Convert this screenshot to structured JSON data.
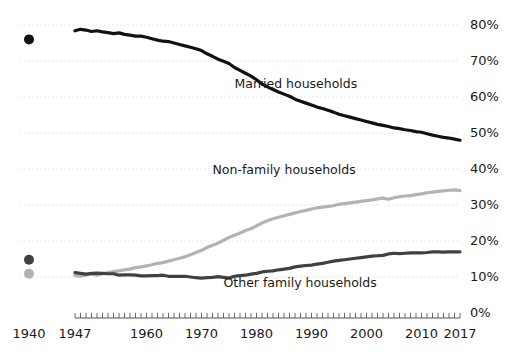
{
  "chart_data": {
    "type": "line",
    "title": "",
    "xlabel": "",
    "ylabel": "",
    "xlim": [
      1947,
      2017
    ],
    "ylim": [
      0,
      85
    ],
    "grid": true,
    "legend_position": "inline-annotations",
    "y_ticks": [
      "0%",
      "10%",
      "20%",
      "30%",
      "40%",
      "50%",
      "60%",
      "70%",
      "80%"
    ],
    "y_tick_values": [
      0,
      10,
      20,
      30,
      40,
      50,
      60,
      70,
      80
    ],
    "x_ticks": [
      "1940",
      "1947",
      "1960",
      "1970",
      "1980",
      "1990",
      "2000",
      "2010",
      "2017"
    ],
    "x_tick_values": [
      1940,
      1947,
      1960,
      1970,
      1980,
      1990,
      2000,
      2010,
      2017
    ],
    "x_tick_detached": [
      1940
    ],
    "x_minor_tick_step": 1,
    "detached_points": [
      {
        "label": "Married households",
        "year": 1940,
        "value": 76.0,
        "color": "#111111"
      },
      {
        "label": "Other family households",
        "year": 1940,
        "value": 14.8,
        "color": "#404040"
      },
      {
        "label": "Non-family households",
        "year": 1940,
        "value": 10.9,
        "color": "#b3b3b3"
      }
    ],
    "series": [
      {
        "name": "Married households",
        "color": "#111111",
        "width": 3.2,
        "label_x": 1976,
        "label_y": 62.5,
        "x": [
          1947,
          1948,
          1949,
          1950,
          1951,
          1952,
          1953,
          1954,
          1955,
          1956,
          1957,
          1958,
          1959,
          1960,
          1961,
          1962,
          1963,
          1964,
          1965,
          1966,
          1967,
          1968,
          1969,
          1970,
          1971,
          1972,
          1973,
          1974,
          1975,
          1976,
          1977,
          1978,
          1979,
          1980,
          1981,
          1982,
          1983,
          1984,
          1985,
          1986,
          1987,
          1988,
          1989,
          1990,
          1991,
          1992,
          1993,
          1994,
          1995,
          1996,
          1997,
          1998,
          1999,
          2000,
          2001,
          2002,
          2003,
          2004,
          2005,
          2006,
          2007,
          2008,
          2009,
          2010,
          2011,
          2012,
          2013,
          2014,
          2015,
          2016,
          2017
        ],
        "values": [
          78.4,
          78.8,
          78.6,
          78.2,
          78.4,
          78.1,
          77.9,
          77.6,
          77.8,
          77.4,
          77.2,
          76.9,
          76.9,
          76.6,
          76.2,
          75.8,
          75.5,
          75.4,
          75.0,
          74.6,
          74.2,
          73.8,
          73.4,
          72.9,
          72.0,
          71.3,
          70.5,
          69.9,
          69.3,
          68.2,
          67.4,
          66.6,
          65.8,
          64.8,
          63.6,
          62.8,
          62.1,
          61.4,
          60.8,
          60.2,
          59.4,
          58.8,
          58.3,
          57.8,
          57.2,
          56.8,
          56.3,
          55.8,
          55.2,
          54.8,
          54.4,
          54.0,
          53.6,
          53.2,
          52.8,
          52.4,
          52.1,
          51.8,
          51.4,
          51.2,
          50.9,
          50.7,
          50.4,
          50.2,
          49.8,
          49.4,
          49.1,
          48.8,
          48.6,
          48.3,
          48.0
        ]
      },
      {
        "name": "Non-family households",
        "color": "#b3b3b3",
        "width": 3.2,
        "label_x": 1972,
        "label_y": 38.5,
        "x": [
          1947,
          1948,
          1949,
          1950,
          1951,
          1952,
          1953,
          1954,
          1955,
          1956,
          1957,
          1958,
          1959,
          1960,
          1961,
          1962,
          1963,
          1964,
          1965,
          1966,
          1967,
          1968,
          1969,
          1970,
          1971,
          1972,
          1973,
          1974,
          1975,
          1976,
          1977,
          1978,
          1979,
          1980,
          1981,
          1982,
          1983,
          1984,
          1985,
          1986,
          1987,
          1988,
          1989,
          1990,
          1991,
          1992,
          1993,
          1994,
          1995,
          1996,
          1997,
          1998,
          1999,
          2000,
          2001,
          2002,
          2003,
          2004,
          2005,
          2006,
          2007,
          2008,
          2009,
          2010,
          2011,
          2012,
          2013,
          2014,
          2015,
          2016,
          2017
        ],
        "values": [
          10.4,
          10.2,
          10.6,
          10.8,
          10.5,
          10.9,
          11.2,
          11.5,
          11.7,
          12.0,
          12.2,
          12.6,
          12.8,
          13.1,
          13.4,
          13.8,
          14.0,
          14.4,
          14.8,
          15.2,
          15.6,
          16.2,
          16.8,
          17.4,
          18.2,
          18.8,
          19.4,
          20.2,
          21.0,
          21.6,
          22.2,
          22.9,
          23.4,
          24.2,
          25.0,
          25.6,
          26.2,
          26.6,
          27.0,
          27.4,
          27.8,
          28.2,
          28.5,
          28.9,
          29.2,
          29.4,
          29.6,
          29.8,
          30.2,
          30.4,
          30.6,
          30.8,
          31.0,
          31.2,
          31.4,
          31.7,
          31.9,
          31.6,
          32.0,
          32.3,
          32.5,
          32.6,
          32.9,
          33.1,
          33.4,
          33.6,
          33.8,
          33.9,
          34.1,
          34.2,
          34.0
        ]
      },
      {
        "name": "Other family households",
        "color": "#404040",
        "width": 3.2,
        "label_x": 1974,
        "label_y": 7.2,
        "x": [
          1947,
          1948,
          1949,
          1950,
          1951,
          1952,
          1953,
          1954,
          1955,
          1956,
          1957,
          1958,
          1959,
          1960,
          1961,
          1962,
          1963,
          1964,
          1965,
          1966,
          1967,
          1968,
          1969,
          1970,
          1971,
          1972,
          1973,
          1974,
          1975,
          1976,
          1977,
          1978,
          1979,
          1980,
          1981,
          1982,
          1983,
          1984,
          1985,
          1986,
          1987,
          1988,
          1989,
          1990,
          1991,
          1992,
          1993,
          1994,
          1995,
          1996,
          1997,
          1998,
          1999,
          2000,
          2001,
          2002,
          2003,
          2004,
          2005,
          2006,
          2007,
          2008,
          2009,
          2010,
          2011,
          2012,
          2013,
          2014,
          2015,
          2016,
          2017
        ],
        "values": [
          11.2,
          11.0,
          10.8,
          11.0,
          11.1,
          11.0,
          10.9,
          10.9,
          10.5,
          10.6,
          10.6,
          10.5,
          10.3,
          10.3,
          10.4,
          10.4,
          10.5,
          10.2,
          10.2,
          10.2,
          10.2,
          10.0,
          9.8,
          9.7,
          9.8,
          9.9,
          10.1,
          9.9,
          9.7,
          10.2,
          10.4,
          10.5,
          10.8,
          11.0,
          11.4,
          11.6,
          11.7,
          12.0,
          12.2,
          12.4,
          12.8,
          13.0,
          13.2,
          13.3,
          13.6,
          13.8,
          14.1,
          14.4,
          14.6,
          14.8,
          15.0,
          15.2,
          15.4,
          15.6,
          15.8,
          15.9,
          16.0,
          16.4,
          16.6,
          16.5,
          16.6,
          16.7,
          16.7,
          16.7,
          16.8,
          17.0,
          17.0,
          16.9,
          17.0,
          17.0,
          17.0
        ]
      }
    ]
  }
}
